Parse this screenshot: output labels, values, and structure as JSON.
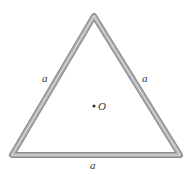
{
  "diagram": {
    "shape": "equilateral-triangle",
    "vertices": {
      "apex": [
        94,
        16
      ],
      "bottom_left": [
        12,
        155
      ],
      "bottom_right": [
        180,
        155
      ]
    },
    "rod_color": "#9a9a9a",
    "rod_highlight": "#d8d8d8",
    "side_labels": {
      "left": "a",
      "right": "a",
      "bottom": "a"
    },
    "center_point": {
      "label": "O",
      "position": [
        95,
        106
      ]
    }
  }
}
